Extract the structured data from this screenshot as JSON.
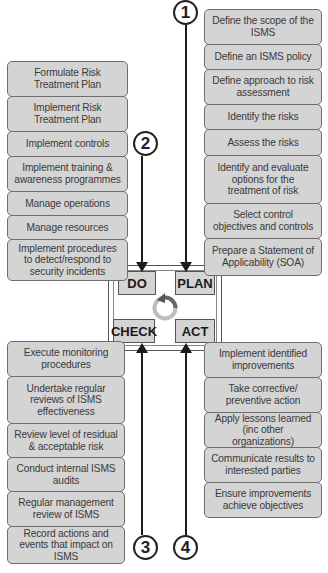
{
  "diagram": {
    "type": "PDCA cycle",
    "center": {
      "do_label": "DO",
      "plan_label": "PLAN",
      "check_label": "CHECK",
      "act_label": "ACT"
    },
    "steps": {
      "one": "1",
      "two": "2",
      "three": "3",
      "four": "4"
    },
    "plan": {
      "items": [
        "Define the scope of the ISMS",
        "Define an ISMS policy",
        "Define approach to risk assessment",
        "Identify the risks",
        "Assess the risks",
        "Identify and evaluate options for the treatment of risk",
        "Select control objectives and controls",
        "Prepare a Statement of Applicability (SOA)"
      ]
    },
    "do": {
      "items": [
        "Formulate Risk Treatment Plan",
        "Implement Risk Treatment Plan",
        "Implement controls",
        "Implement training & awareness programmes",
        "Manage operations",
        "Manage resources",
        "Implement procedures to detect/respond to security incidents"
      ]
    },
    "check": {
      "items": [
        "Execute monitoring procedures",
        "Undertake regular reviews of ISMS effectiveness",
        "Review level of residual & acceptable risk",
        "Conduct internal ISMS audits",
        "Regular management review of ISMS",
        "Record actions and events that impact on ISMS"
      ]
    },
    "act": {
      "items": [
        "Implement identified improvements",
        "Take corrective/ preventive action",
        "Apply lessons learned (inc other organizations)",
        "Communicate results to interested parties",
        "Ensure improvements achieve objectives"
      ]
    },
    "colors": {
      "box_fill": "#d4d4d4",
      "box_border": "#6e6e6e",
      "text": "#3a3a3a",
      "arrow": "#1c1c1c",
      "cycle_ring": "#bdbdbd",
      "cycle_arrowhead": "#555555"
    }
  }
}
